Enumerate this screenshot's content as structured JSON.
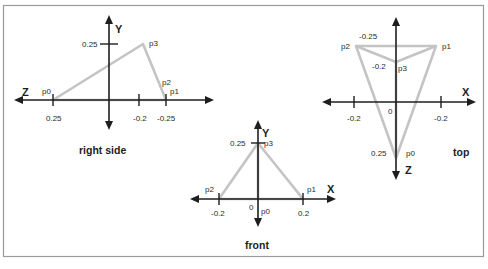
{
  "colors": {
    "axis": "#1e1e1e",
    "triangle": "#c4c4c4",
    "frame": "#9a9a9a",
    "background": "#ffffff"
  },
  "views": {
    "right_side": {
      "title": "right side",
      "axis_h": "Z",
      "axis_v": "Y",
      "ticks": {
        "y_pos": "0.25",
        "z_pos": "0.25",
        "z_neg1": "-0.2",
        "z_neg2": "-0.25"
      },
      "points": {
        "p0": "p0",
        "p1": "p1",
        "p2": "p2",
        "p3": "p3"
      }
    },
    "top": {
      "title": "top",
      "axis_h": "X",
      "axis_v": "Z",
      "ticks": {
        "z_neg_top": "-0.25",
        "z_neg_mid": "-0.2",
        "origin": "0",
        "x_left": "-0.2",
        "x_right": "-0.2",
        "z_pos": "0.25"
      },
      "points": {
        "p0": "p0",
        "p1": "p1",
        "p2": "p2",
        "p3": "p3"
      }
    },
    "front": {
      "title": "front",
      "axis_h": "X",
      "axis_v": "Y",
      "ticks": {
        "y_pos": "0.25",
        "origin": "0",
        "x_neg": "-0.2",
        "x_pos": "0.2"
      },
      "points": {
        "p0": "p0",
        "p1": "p1",
        "p2": "p2",
        "p3": "p3"
      }
    }
  }
}
